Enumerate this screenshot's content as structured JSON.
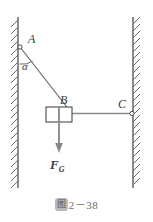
{
  "figure": {
    "caption_badge": "图",
    "caption_text": "2－38",
    "labels": {
      "point_a": "A",
      "point_b": "B",
      "point_c": "C",
      "angle": "α",
      "force_main": "F",
      "force_sub": "G"
    },
    "colors": {
      "stroke": "#4a4a4a",
      "wall": "#5a5a5a",
      "hatch": "#6b6b6b",
      "rope": "#6a6a6a",
      "arrow": "#787878",
      "label": "#3a3a3a",
      "caption": "#6e6e6e",
      "badge_bg": "#b9b9b9",
      "background": "#ffffff"
    },
    "geometry": {
      "left_wall_x": 18,
      "right_wall_x": 133,
      "wall_top_y": 17,
      "wall_bottom_y": 188,
      "point_a": [
        20,
        47
      ],
      "point_b": [
        70,
        110
      ],
      "point_c": [
        132,
        114
      ],
      "block": {
        "x": 46,
        "y": 107,
        "width": 26,
        "height": 15
      },
      "force_arrow": {
        "x": 59,
        "y1": 107,
        "y2": 152
      },
      "angle_arc_radius": 17
    }
  }
}
